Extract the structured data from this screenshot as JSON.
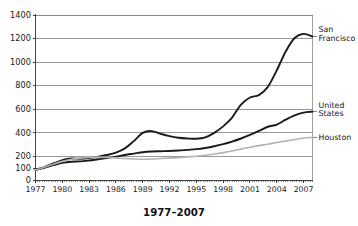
{
  "chart_data": {
    "type": "line",
    "title": "",
    "xlabel": "1977–2007",
    "ylabel": "",
    "ylim": [
      0,
      1400
    ],
    "xlim": [
      1977,
      2008
    ],
    "grid": true,
    "legend_position": "right-inline",
    "y_ticks": [
      0,
      100,
      200,
      400,
      600,
      800,
      1000,
      1200,
      1400
    ],
    "y_gridlines": [
      200,
      400,
      600,
      800,
      1000,
      1200,
      1400
    ],
    "x_ticks": [
      1977,
      1980,
      1983,
      1986,
      1989,
      1992,
      1995,
      1998,
      2001,
      2004,
      2007
    ],
    "x_minor_tick_interval_years": 0.25,
    "series": [
      {
        "name": "San Francisco",
        "label_lines": [
          "San",
          "Francisco"
        ],
        "color": "#1b1b1b",
        "width": 1.9,
        "x": [
          1977,
          1978,
          1979,
          1980,
          1981,
          1982,
          1983,
          1984,
          1985,
          1986,
          1987,
          1988,
          1989,
          1990,
          1991,
          1992,
          1993,
          1994,
          1995,
          1996,
          1997,
          1998,
          1999,
          2000,
          2001,
          2002,
          2003,
          2004,
          2005,
          2006,
          2007,
          2008
        ],
        "values": [
          88,
          110,
          140,
          168,
          182,
          180,
          186,
          198,
          212,
          232,
          268,
          330,
          400,
          415,
          392,
          372,
          358,
          352,
          350,
          362,
          400,
          455,
          530,
          640,
          700,
          720,
          790,
          930,
          1090,
          1205,
          1240,
          1218
        ]
      },
      {
        "name": "United States",
        "label_lines": [
          "United",
          "States"
        ],
        "color": "#1b1b1b",
        "width": 1.9,
        "x": [
          1977,
          1978,
          1979,
          1980,
          1981,
          1982,
          1983,
          1984,
          1985,
          1986,
          1987,
          1988,
          1989,
          1990,
          1991,
          1992,
          1993,
          1994,
          1995,
          1996,
          1997,
          1998,
          1999,
          2000,
          2001,
          2002,
          2003,
          2004,
          2005,
          2006,
          2007,
          2008
        ],
        "values": [
          86,
          104,
          126,
          145,
          155,
          158,
          166,
          176,
          186,
          198,
          212,
          224,
          236,
          242,
          244,
          246,
          250,
          256,
          262,
          272,
          286,
          304,
          326,
          352,
          382,
          416,
          452,
          470,
          512,
          548,
          572,
          580
        ]
      },
      {
        "name": "Houston",
        "label_lines": [
          "Houston"
        ],
        "color": "#b3b3b3",
        "width": 1.6,
        "x": [
          1977,
          1978,
          1979,
          1980,
          1981,
          1982,
          1983,
          1984,
          1985,
          1986,
          1987,
          1988,
          1989,
          1990,
          1991,
          1992,
          1993,
          1994,
          1995,
          1996,
          1997,
          1998,
          1999,
          2000,
          2001,
          2002,
          2003,
          2004,
          2005,
          2006,
          2007,
          2008
        ],
        "values": [
          86,
          108,
          134,
          158,
          176,
          186,
          192,
          194,
          192,
          188,
          182,
          178,
          176,
          178,
          182,
          186,
          190,
          196,
          202,
          210,
          220,
          232,
          246,
          262,
          278,
          292,
          304,
          318,
          330,
          344,
          356,
          362
        ]
      }
    ]
  }
}
